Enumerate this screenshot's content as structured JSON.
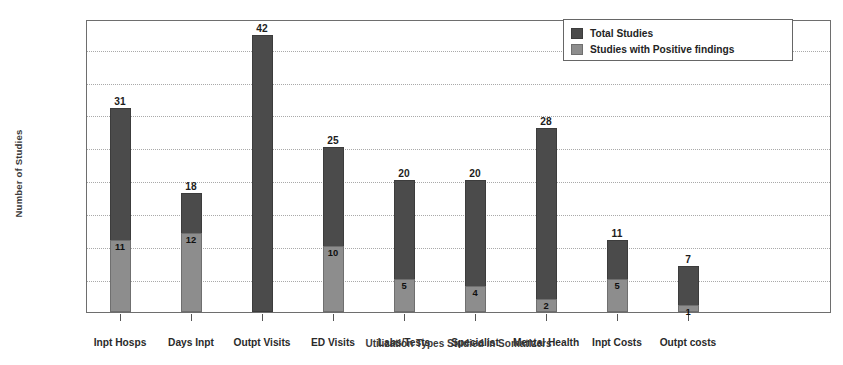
{
  "chart_data": {
    "type": "bar",
    "subtype": "stacked-bar",
    "title": "",
    "xlabel": "Utilization Types Studied in Somatizers",
    "ylabel": "Number of Studies",
    "ylim": [
      0,
      44.5
    ],
    "ytick_step": 5,
    "ytick_labels": [
      "0",
      "5",
      "10",
      "15",
      "20",
      "25",
      "30",
      "35",
      "40"
    ],
    "ytick_values": [
      0,
      5,
      10,
      15,
      20,
      25,
      30,
      35,
      40
    ],
    "minor_tick_step": 1,
    "grid": "horizontal-dotted",
    "legend_position": "upper-right",
    "categories": [
      "Inpt Hosps",
      "Days Inpt",
      "Outpt Visits",
      "ED Visits",
      "Labs/Tests",
      "Specialist",
      "Mental Health",
      "Inpt Costs",
      "Outpt costs"
    ],
    "series": [
      {
        "name": "Total Studies",
        "color": "#4b4b4b",
        "values": [
          31,
          18,
          42,
          25,
          20,
          20,
          28,
          11,
          7
        ],
        "labels": [
          "31",
          "18",
          "42",
          "25",
          "20",
          "20",
          "28",
          "11",
          "7"
        ]
      },
      {
        "name": "Studies with Positive findings",
        "color": "#8d8d8d",
        "values": [
          11,
          12,
          0,
          10,
          5,
          4,
          2,
          5,
          1
        ],
        "labels": [
          "11",
          "12",
          "",
          "10",
          "5",
          "4",
          "2",
          "5",
          "1"
        ]
      }
    ]
  },
  "legend": {
    "items": [
      {
        "label": "Total Studies",
        "color": "#4b4b4b"
      },
      {
        "label": "Studies with Positive findings",
        "color": "#8d8d8d"
      }
    ]
  },
  "colors": {
    "total": "#4b4b4b",
    "positive": "#8d8d8d",
    "frame": "#6e6e6e",
    "grid": "#a9a9a9",
    "background": "#ffffff"
  }
}
